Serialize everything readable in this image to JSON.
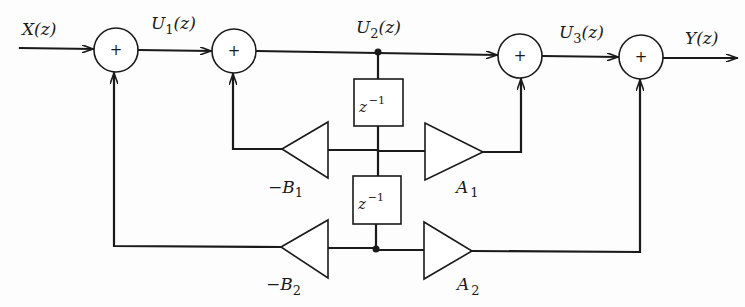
{
  "diagram": {
    "type": "second-order IIR filter signal-flow block diagram",
    "signals": {
      "input": {
        "base": "X",
        "sub": "",
        "arg": "(z)"
      },
      "u1": {
        "base": "U",
        "sub": "1",
        "arg": "(z)"
      },
      "u2": {
        "base": "U",
        "sub": "2",
        "arg": "(z)"
      },
      "u3": {
        "base": "U",
        "sub": "3",
        "arg": "(z)"
      },
      "output": {
        "base": "Y",
        "sub": "",
        "arg": "(z)"
      }
    },
    "adders": [
      {
        "id": "adder-1",
        "symbol": "+"
      },
      {
        "id": "adder-2",
        "symbol": "+"
      },
      {
        "id": "adder-3",
        "symbol": "+"
      },
      {
        "id": "adder-4",
        "symbol": "+"
      }
    ],
    "delays": [
      {
        "id": "delay-1",
        "base": "z",
        "exp": "−1"
      },
      {
        "id": "delay-2",
        "base": "z",
        "exp": "−1"
      }
    ],
    "gains": [
      {
        "id": "gain-neg-b1",
        "prefix": "−",
        "base": "B",
        "sub": "1"
      },
      {
        "id": "gain-a1",
        "prefix": "",
        "base": "A",
        "sub": "1"
      },
      {
        "id": "gain-neg-b2",
        "prefix": "−",
        "base": "B",
        "sub": "2"
      },
      {
        "id": "gain-a2",
        "prefix": "",
        "base": "A",
        "sub": "2"
      }
    ],
    "colors": {
      "ink": "#1a1a1a",
      "background": "#fdfdfd"
    }
  }
}
